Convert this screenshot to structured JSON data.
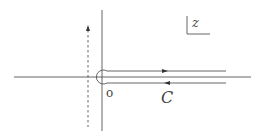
{
  "diagram": {
    "labels": {
      "origin": "o",
      "contour": "C",
      "plane": "z"
    },
    "colors": {
      "line": "#555555",
      "text": "#444444",
      "background": "#ffffff"
    },
    "elements": [
      {
        "name": "real-axis",
        "style": "solid"
      },
      {
        "name": "imaginary-axis",
        "style": "solid"
      },
      {
        "name": "dashed-vertical-line",
        "style": "dashed",
        "arrow": "up"
      },
      {
        "name": "upper-branch",
        "direction": "right"
      },
      {
        "name": "lower-branch",
        "direction": "left"
      },
      {
        "name": "small-circle-around-origin"
      }
    ]
  }
}
